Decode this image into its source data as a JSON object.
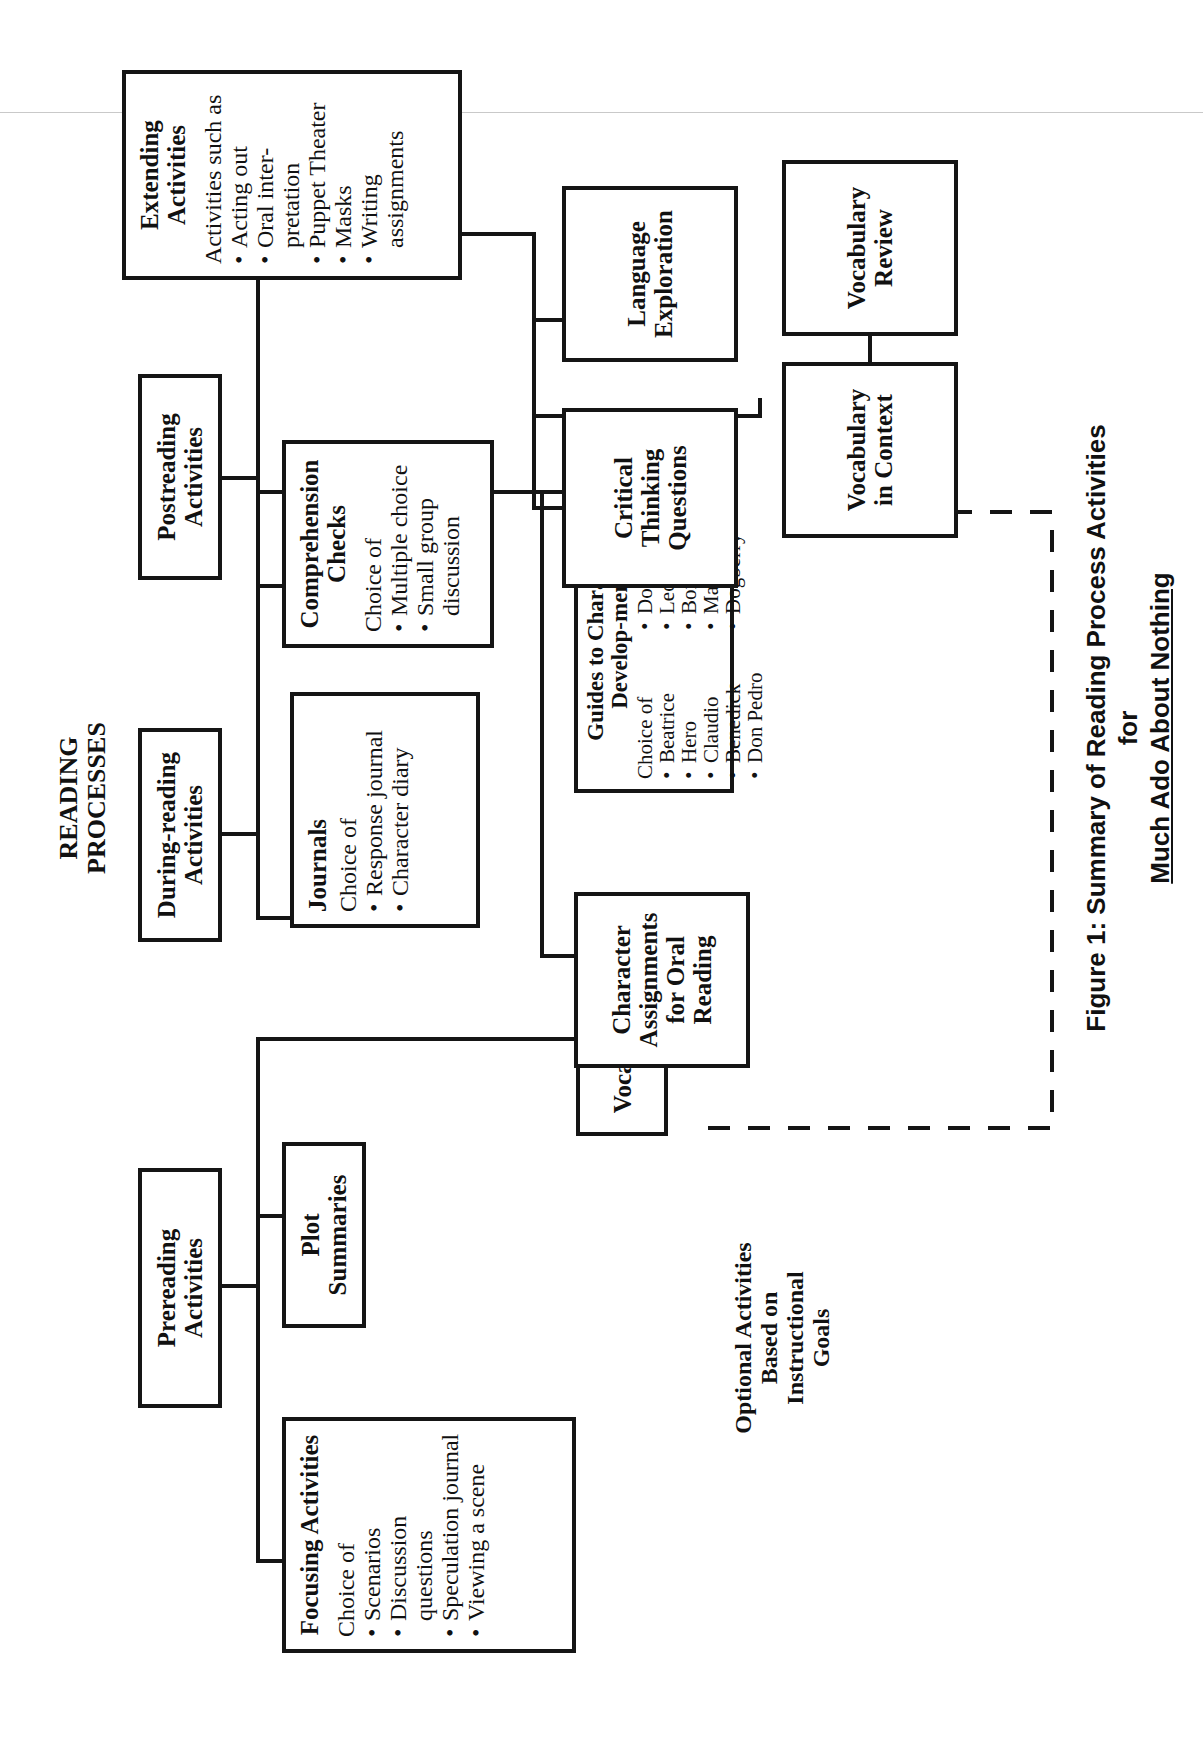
{
  "heading": {
    "line1": "READING",
    "line2": "PROCESSES"
  },
  "prereading": {
    "title": "Prereading Activities",
    "focusing": {
      "title": "Focusing Activities",
      "intro": "Choice of",
      "items": [
        "Scenarios",
        "Discussion questions",
        "Speculation journal",
        "Viewing a scene"
      ]
    },
    "plot_summaries": {
      "title": "Plot Summaries"
    },
    "vocabulary": {
      "title": "Vocabulary"
    }
  },
  "during_reading": {
    "title": "During-reading Activities",
    "journals": {
      "title": "Journals",
      "intro": "Choice of",
      "items": [
        "Response journal",
        "Character diary"
      ]
    },
    "character_assignments": {
      "title": "Character Assignments for Oral Reading"
    },
    "guides": {
      "title": "Guides to Character Develop-ment",
      "intro": "Choice of",
      "items": [
        "Beatrice",
        "Hero",
        "Claudio",
        "Benedick",
        "Don Pedro",
        "Don John",
        "Leonato",
        "Borachio",
        "Margaret",
        "Dogberry"
      ]
    }
  },
  "postreading": {
    "title": "Postreading Activities",
    "comprehension": {
      "title": "Comprehension Checks",
      "intro": "Choice of",
      "items": [
        "Multiple choice",
        "Small group discussion"
      ]
    },
    "critical_thinking": {
      "title": "Critical Thinking Questions"
    },
    "language_exploration": {
      "title": "Language Exploration"
    },
    "vocab_in_context": {
      "title": "Vocabulary in Context"
    },
    "vocab_review": {
      "title": "Vocabulary Review"
    }
  },
  "extending": {
    "title": "Extending Activities",
    "intro": "Activities such as",
    "items": [
      "Acting out",
      "Oral inter-pretation",
      "Puppet Theater",
      "Masks",
      "Writing assignments"
    ]
  },
  "optional_label": {
    "line1": "Optional  Activities",
    "line2": "Based on",
    "line3": "Instructional",
    "line4": "Goals"
  },
  "caption": {
    "prefix": "Figure 1:  Summary of Reading Process Activities for",
    "title": "Much Ado About Nothing"
  }
}
